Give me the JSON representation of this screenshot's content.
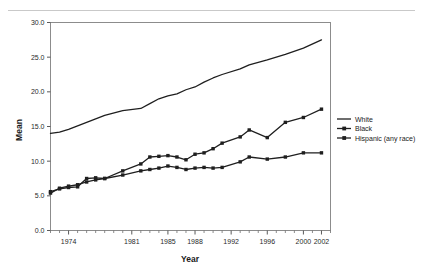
{
  "figure": {
    "background": "#ffffff",
    "frame_color": "#8c8c8c",
    "line_color": "#1f1f1f"
  },
  "chart_data": {
    "type": "line",
    "title": "",
    "xlabel": "Year",
    "ylabel": "Mean",
    "xlim": [
      1972,
      2003
    ],
    "ylim": [
      0.0,
      30.0
    ],
    "yticks": [
      "0.0",
      "5.0",
      "10.0",
      "15.0",
      "20.0",
      "25.0",
      "30.0"
    ],
    "ytick_values": [
      0.0,
      5.0,
      10.0,
      15.0,
      20.0,
      25.0,
      30.0
    ],
    "xticks": [
      "1974",
      "1981",
      "1985",
      "1988",
      "1992",
      "1996",
      "2000",
      "2002"
    ],
    "xtick_values": [
      1974,
      1981,
      1985,
      1988,
      1992,
      1996,
      2000,
      2002
    ],
    "grid": false,
    "legend_position": "right",
    "x": [
      1972,
      1973,
      1974,
      1975,
      1976,
      1977,
      1978,
      1980,
      1982,
      1983,
      1984,
      1985,
      1986,
      1987,
      1988,
      1989,
      1990,
      1991,
      1993,
      1994,
      1996,
      1998,
      2000,
      2002
    ],
    "series": [
      {
        "name": "White",
        "marker": "none",
        "color": "#1f1f1f",
        "values": [
          14.0,
          14.2,
          14.6,
          15.1,
          15.6,
          16.1,
          16.6,
          17.3,
          17.6,
          18.3,
          19.0,
          19.4,
          19.7,
          20.3,
          20.7,
          21.4,
          22.0,
          22.5,
          23.3,
          23.9,
          24.6,
          25.4,
          26.3,
          27.5
        ]
      },
      {
        "name": "Black",
        "marker": "square",
        "color": "#1f1f1f",
        "values": [
          5.4,
          6.1,
          6.4,
          6.6,
          7.0,
          7.3,
          7.5,
          8.6,
          9.6,
          10.6,
          10.7,
          10.8,
          10.6,
          10.2,
          11.0,
          11.2,
          11.8,
          12.6,
          13.5,
          14.5,
          13.4,
          15.6,
          16.3,
          17.5
        ]
      },
      {
        "name": "Hispanic (any race)",
        "marker": "square",
        "color": "#1f1f1f",
        "values": [
          5.6,
          6.0,
          6.2,
          6.3,
          7.5,
          7.6,
          7.5,
          8.0,
          8.6,
          8.8,
          9.0,
          9.3,
          9.1,
          8.8,
          9.0,
          9.1,
          9.0,
          9.1,
          9.9,
          10.6,
          10.3,
          10.6,
          11.2,
          11.2
        ]
      }
    ]
  },
  "legend": {
    "entries": [
      {
        "label": "White",
        "marker": "none"
      },
      {
        "label": "Black",
        "marker": "square"
      },
      {
        "label": "Hispanic (any race)",
        "marker": "square"
      }
    ]
  }
}
